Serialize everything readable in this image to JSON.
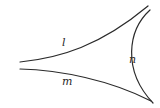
{
  "diagram": {
    "type": "hand-drawn curve sketch",
    "curves": [
      {
        "id": "l",
        "label": "l",
        "description": "upper curve rising to top-right"
      },
      {
        "id": "m",
        "label": "m",
        "description": "lower curve descending to bottom-right"
      },
      {
        "id": "n",
        "label": "n",
        "description": "arc on the right, concave toward the right"
      }
    ],
    "labels": {
      "l": "l",
      "m": "m",
      "n": "n"
    },
    "stroke_color": "#2a2a2a",
    "background": "#ffffff"
  }
}
